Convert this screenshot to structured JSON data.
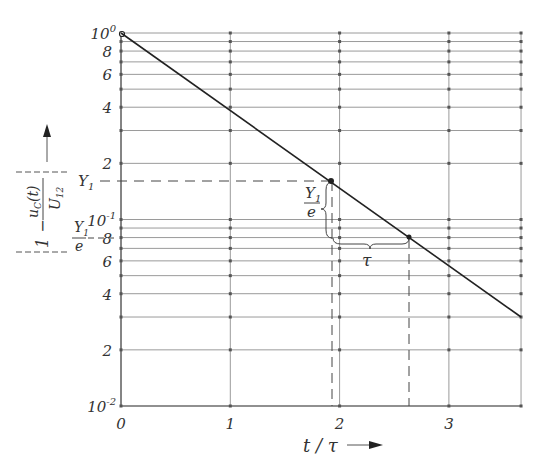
{
  "chart_data": {
    "type": "line",
    "title": "",
    "xlabel": "t/τ",
    "ylabel": "|1 − u_C(t)/U_12|",
    "yscale": "log",
    "xlim": [
      0,
      3.66
    ],
    "ylim": [
      0.01,
      1
    ],
    "grid": true,
    "x_ticks": [
      "0",
      "1",
      "2",
      "3"
    ],
    "y_ticks": [
      {
        "value": 1,
        "label": "10",
        "sup": "0"
      },
      {
        "value": 0.8,
        "label": "8"
      },
      {
        "value": 0.6,
        "label": "6"
      },
      {
        "value": 0.4,
        "label": "4"
      },
      {
        "value": 0.2,
        "label": "2"
      },
      {
        "value": 0.1,
        "label": "10",
        "sup": "-1"
      },
      {
        "value": 0.08,
        "label": "8"
      },
      {
        "value": 0.06,
        "label": "6"
      },
      {
        "value": 0.04,
        "label": "4"
      },
      {
        "value": 0.02,
        "label": "2"
      },
      {
        "value": 0.01,
        "label": "10",
        "sup": "-2"
      }
    ],
    "y_gridlines": [
      1,
      0.9,
      0.8,
      0.7,
      0.6,
      0.5,
      0.4,
      0.3,
      0.2,
      0.1,
      0.09,
      0.08,
      0.07,
      0.06,
      0.05,
      0.04,
      0.03,
      0.02,
      0.01
    ],
    "x_gridlines": [
      0,
      1,
      2,
      3,
      3.66
    ],
    "series": [
      {
        "name": "|1 − u_C(t)/U_12|",
        "x": [
          0,
          1,
          1.92,
          2.64,
          3,
          3.66
        ],
        "values": [
          1.0,
          0.38,
          0.162,
          0.079,
          0.056,
          0.03
        ]
      }
    ],
    "annotations": [
      {
        "text": "Y1",
        "at": {
          "x": 1.92,
          "y": 0.162
        },
        "note": "dashed horizontal reference to y-axis"
      },
      {
        "text": "Y1/e",
        "at": {
          "x": 2.64,
          "y": 0.079
        },
        "note": "brace between Y1 and Y1/e levels"
      },
      {
        "text": "τ",
        "note": "brace spanning horizontal distance from t≈1.92 to t≈2.64"
      }
    ]
  },
  "labels": {
    "y_axis_main": "1 −",
    "y_axis_num": "u",
    "y_axis_num_sub": "C",
    "y_axis_num_rest": "(t)",
    "y_axis_den": "U",
    "y_axis_den_sub": "12",
    "x_axis": "t / τ",
    "y1": "Y",
    "y1_sub": "1",
    "y1e_num": "Y",
    "y1e_sub": "1",
    "y1e_den": "e",
    "tau": "τ"
  },
  "colors": {
    "line": "#222222",
    "grid": "#9a9a9a",
    "text": "#333333"
  }
}
